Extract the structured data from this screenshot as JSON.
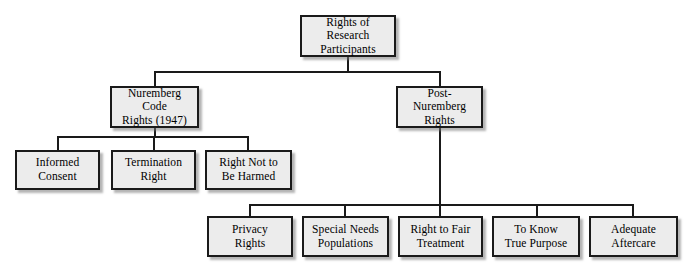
{
  "diagram": {
    "title": "Rights of Research Participants",
    "type": "hierarchy-tree",
    "box_fill_color": "#ececec",
    "box_border_color": "#1a1a1a",
    "background_color": "#ffffff",
    "connector_color": "#1a1a1a"
  },
  "nodes": {
    "root": {
      "label": "Rights of Research\nParticipants",
      "line1": "Rights of Research",
      "line2": "Participants"
    },
    "level2": [
      {
        "id": "nuremberg-code-rights",
        "label": "Nuremberg Code\nRights (1947)",
        "line1": "Nuremberg Code",
        "line2": "Rights (1947)"
      },
      {
        "id": "post-nuremberg-rights",
        "label": "Post-Nuremberg\nRights",
        "line1": "Post-Nuremberg",
        "line2": "Rights"
      }
    ],
    "nuremberg_children": [
      {
        "id": "informed-consent",
        "label": "Informed\nConsent",
        "line1": "Informed",
        "line2": "Consent"
      },
      {
        "id": "termination-right",
        "label": "Termination\nRight",
        "line1": "Termination",
        "line2": "Right"
      },
      {
        "id": "right-not-to-be-harmed",
        "label": "Right Not to\nBe Harmed",
        "line1": "Right Not to",
        "line2": "Be Harmed"
      }
    ],
    "post_nuremberg_children": [
      {
        "id": "privacy-rights",
        "label": "Privacy\nRights",
        "line1": "Privacy",
        "line2": "Rights"
      },
      {
        "id": "special-needs-populations",
        "label": "Special Needs\nPopulations",
        "line1": "Special Needs",
        "line2": "Populations"
      },
      {
        "id": "right-to-fair-treatment",
        "label": "Right to Fair\nTreatment",
        "line1": "Right to Fair",
        "line2": "Treatment"
      },
      {
        "id": "to-know-true-purpose",
        "label": "To Know\nTrue Purpose",
        "line1": "To Know",
        "line2": "True Purpose"
      },
      {
        "id": "adequate-aftercare",
        "label": "Adequate\nAftercare",
        "line1": "Adequate",
        "line2": "Aftercare"
      }
    ]
  }
}
